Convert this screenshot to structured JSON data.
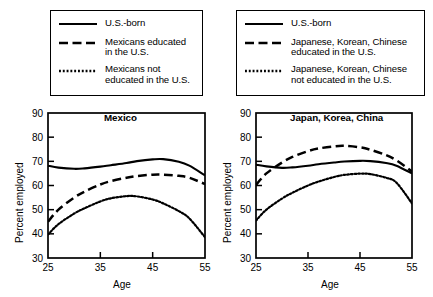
{
  "figure": {
    "type": "multi-panel-line-chart",
    "panels": 2
  },
  "legends": [
    {
      "name": "mexico-legend",
      "entries": [
        {
          "style": "solid",
          "label": "U.S.-born"
        },
        {
          "style": "dashed",
          "label": "Mexicans educated\nin the U.S."
        },
        {
          "style": "dotted",
          "label": "Mexicans not\neducated in the U.S."
        }
      ]
    },
    {
      "name": "asia-legend",
      "entries": [
        {
          "style": "solid",
          "label": "U.S.-born"
        },
        {
          "style": "dashed",
          "label": "Japanese, Korean, Chinese\neducated in the U.S."
        },
        {
          "style": "dotted",
          "label": "Japanese, Korean, Chinese\nnot educated in the U.S."
        }
      ]
    }
  ],
  "chart_data": [
    {
      "type": "line",
      "title": "Mexico",
      "xlabel": "Age",
      "ylabel": "Percent employed",
      "xlim": [
        25,
        55
      ],
      "ylim": [
        30,
        90
      ],
      "xticks": [
        25,
        35,
        45,
        55
      ],
      "yticks": [
        30,
        40,
        50,
        60,
        70,
        80,
        90
      ],
      "grid": false,
      "legend_position": "above-left",
      "x": [
        25,
        27,
        30,
        32,
        35,
        37,
        40,
        42,
        45,
        47,
        50,
        52,
        55
      ],
      "series": [
        {
          "name": "U.S.-born",
          "style": "solid",
          "values": [
            68.2,
            67.4,
            66.9,
            67.1,
            67.8,
            68.4,
            69.3,
            70.1,
            70.8,
            70.9,
            69.8,
            68.2,
            64.2
          ]
        },
        {
          "name": "Mexicans educated in the U.S.",
          "style": "dashed",
          "values": [
            45.0,
            50.0,
            55.0,
            57.5,
            60.4,
            61.8,
            63.2,
            63.9,
            64.5,
            64.5,
            64.0,
            63.2,
            60.6
          ]
        },
        {
          "name": "Mexicans not educated in the U.S.",
          "style": "dotted",
          "values": [
            39.7,
            44.0,
            48.4,
            50.6,
            53.4,
            54.7,
            55.6,
            55.5,
            54.2,
            52.6,
            49.4,
            46.4,
            38.6
          ]
        }
      ]
    },
    {
      "type": "line",
      "title": "Japan, Korea, China",
      "xlabel": "Age",
      "ylabel": "Percent employed",
      "xlim": [
        25,
        55
      ],
      "ylim": [
        30,
        90
      ],
      "xticks": [
        25,
        35,
        45,
        55
      ],
      "yticks": [
        30,
        40,
        50,
        60,
        70,
        80,
        90
      ],
      "grid": false,
      "legend_position": "above-right",
      "x": [
        25,
        27,
        30,
        32,
        35,
        37,
        40,
        42,
        45,
        47,
        50,
        52,
        55
      ],
      "series": [
        {
          "name": "U.S.-born",
          "style": "solid",
          "values": [
            68.6,
            67.9,
            67.3,
            67.5,
            68.2,
            68.8,
            69.5,
            69.9,
            70.2,
            70.1,
            69.3,
            68.2,
            65.0
          ]
        },
        {
          "name": "Japanese, Korean, Chinese educated in the U.S.",
          "style": "dashed",
          "values": [
            60.2,
            65.0,
            69.5,
            71.8,
            74.2,
            75.3,
            76.2,
            76.4,
            75.8,
            74.8,
            72.6,
            70.4,
            65.8
          ]
        },
        {
          "name": "Japanese, Korean, Chinese not educated in the U.S.",
          "style": "dotted",
          "values": [
            45.5,
            50.0,
            54.6,
            57.0,
            60.0,
            61.6,
            63.5,
            64.4,
            64.9,
            64.7,
            63.2,
            61.2,
            52.6
          ]
        }
      ]
    }
  ]
}
